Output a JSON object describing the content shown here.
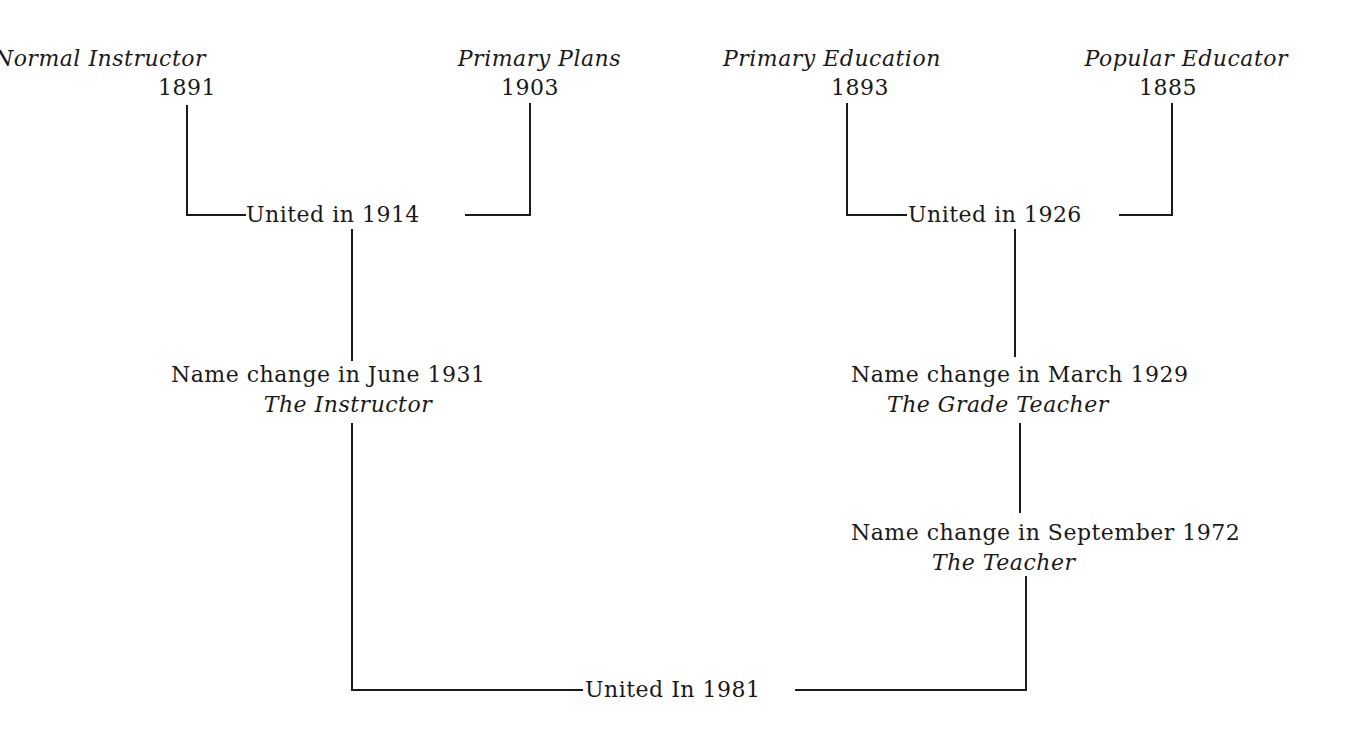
{
  "diagram": {
    "type": "lineage-tree",
    "sources": [
      {
        "title": "Normal Instructor",
        "year": "1891"
      },
      {
        "title": "Primary Plans",
        "year": "1903"
      },
      {
        "title": "Primary Education",
        "year": "1893"
      },
      {
        "title": "Popular Educator",
        "year": "1885"
      }
    ],
    "mergers": [
      {
        "label": "United in 1914"
      },
      {
        "label": "United in 1926"
      },
      {
        "label": "United In 1981"
      }
    ],
    "name_changes": [
      {
        "label": "Name change in June 1931",
        "new_title": "The Instructor"
      },
      {
        "label": "Name change in March 1929",
        "new_title": "The Grade Teacher"
      },
      {
        "label": "Name change in September 1972",
        "new_title": "The Teacher"
      }
    ],
    "edges": [
      {
        "from": "Normal Instructor",
        "to": "United in 1914"
      },
      {
        "from": "Primary Plans",
        "to": "United in 1914"
      },
      {
        "from": "Primary Education",
        "to": "United in 1926"
      },
      {
        "from": "Popular Educator",
        "to": "United in 1926"
      },
      {
        "from": "United in 1914",
        "to": "The Instructor"
      },
      {
        "from": "United in 1926",
        "to": "The Grade Teacher"
      },
      {
        "from": "The Grade Teacher",
        "to": "The Teacher"
      },
      {
        "from": "The Instructor",
        "to": "United In 1981"
      },
      {
        "from": "The Teacher",
        "to": "United In 1981"
      }
    ]
  }
}
